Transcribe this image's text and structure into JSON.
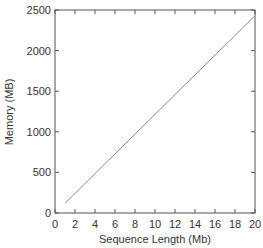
{
  "chart_data": {
    "type": "line",
    "title": "",
    "xlabel": "Sequence Length (Mb)",
    "ylabel": "Memory (MB)",
    "xlim": [
      0,
      20
    ],
    "ylim": [
      0,
      2500
    ],
    "xticks": [
      0,
      2,
      4,
      6,
      8,
      10,
      12,
      14,
      16,
      18,
      20
    ],
    "yticks": [
      0,
      500,
      1000,
      1500,
      2000,
      2500
    ],
    "grid": false,
    "legend": null,
    "series": [
      {
        "name": "Memory",
        "color": "#888888",
        "x": [
          1,
          20
        ],
        "y": [
          120,
          2430
        ]
      }
    ]
  },
  "colors": {
    "axis": "#555555",
    "line": "#888888",
    "text": "#333333"
  }
}
